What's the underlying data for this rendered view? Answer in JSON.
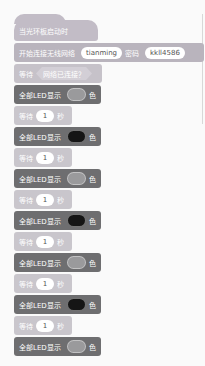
{
  "program": {
    "hat": {
      "label": "当光环板启动时"
    },
    "wifi": {
      "label": "开始连接无线网络",
      "ssid": "tianming",
      "password_label": "密码",
      "password": "kkll4586"
    },
    "wait_until": {
      "label": "等待",
      "condition": "网络已连接？"
    },
    "sequence": [
      {
        "type": "led",
        "label": "全部LED显示",
        "suffix": "色",
        "color": "#9a9a9c"
      },
      {
        "type": "wait",
        "label": "等待",
        "value": "1",
        "unit": "秒"
      },
      {
        "type": "led",
        "label": "全部LED显示",
        "suffix": "色",
        "color": "#151515"
      },
      {
        "type": "wait",
        "label": "等待",
        "value": "1",
        "unit": "秒"
      },
      {
        "type": "led",
        "label": "全部LED显示",
        "suffix": "色",
        "color": "#9a9a9c"
      },
      {
        "type": "wait",
        "label": "等待",
        "value": "1",
        "unit": "秒"
      },
      {
        "type": "led",
        "label": "全部LED显示",
        "suffix": "色",
        "color": "#151515"
      },
      {
        "type": "wait",
        "label": "等待",
        "value": "1",
        "unit": "秒"
      },
      {
        "type": "led",
        "label": "全部LED显示",
        "suffix": "色",
        "color": "#9a9a9c"
      },
      {
        "type": "wait",
        "label": "等待",
        "value": "1",
        "unit": "秒"
      },
      {
        "type": "led",
        "label": "全部LED显示",
        "suffix": "色",
        "color": "#151515"
      },
      {
        "type": "wait",
        "label": "等待",
        "value": "1",
        "unit": "秒"
      },
      {
        "type": "led",
        "label": "全部LED显示",
        "suffix": "色",
        "color": "#9a9a9c"
      }
    ]
  }
}
